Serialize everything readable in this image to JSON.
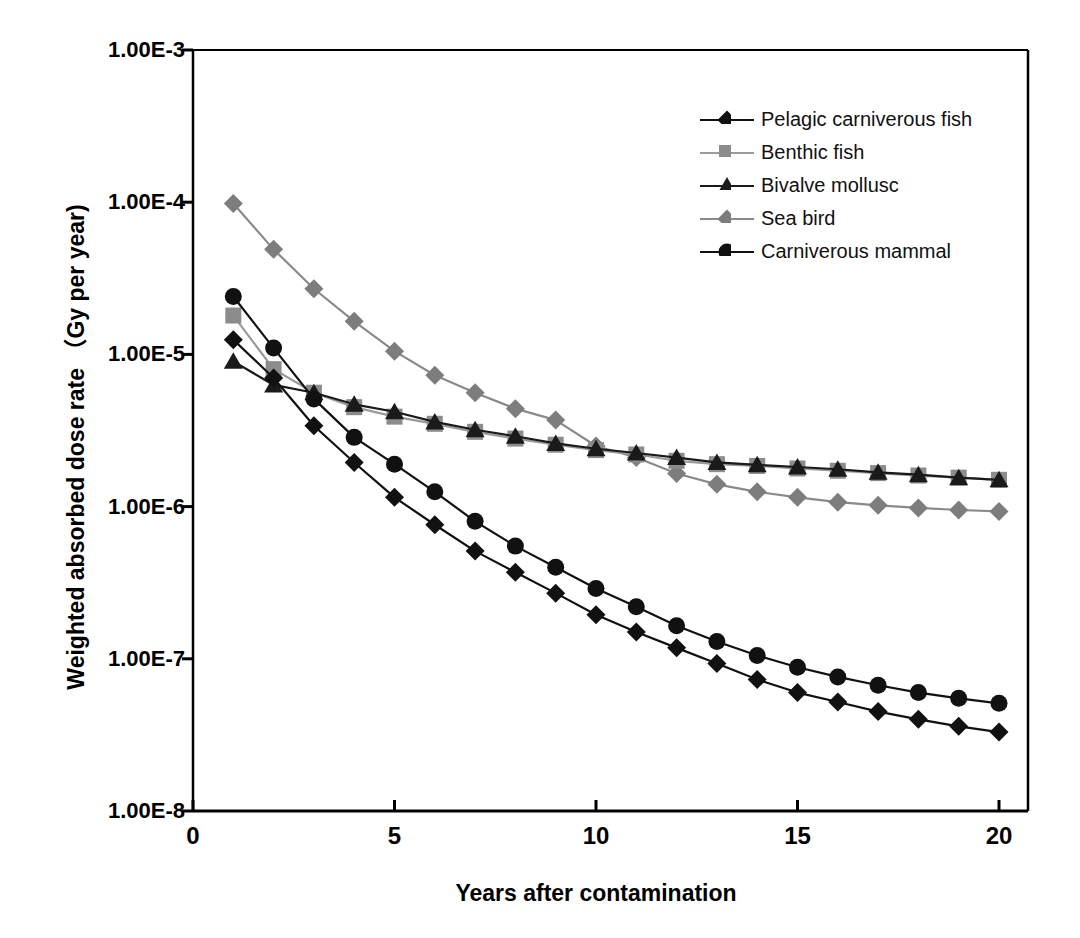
{
  "chart_data": {
    "type": "line",
    "title": "",
    "xlabel": "Years after contamination",
    "ylabel": "Weighted absorbed dose rate （Gy per year)",
    "xlim": [
      0,
      20
    ],
    "ylim": [
      1e-08,
      0.001
    ],
    "yscale": "log",
    "grid": false,
    "legend_position": "top-right",
    "x_ticks": [
      0,
      5,
      10,
      15,
      20
    ],
    "x_tick_labels": [
      "0",
      "5",
      "10",
      "15",
      "20"
    ],
    "y_ticks": [
      0.001,
      0.0001,
      1e-05,
      1e-06,
      1e-07,
      1e-08
    ],
    "y_tick_labels": [
      "1.00E-3",
      "1.00E-4",
      "1.00E-5",
      "1.00E-6",
      "1.00E-7",
      "1.00E-8"
    ],
    "x": [
      1,
      2,
      3,
      4,
      5,
      6,
      7,
      8,
      9,
      10,
      11,
      12,
      13,
      14,
      15,
      16,
      17,
      18,
      19,
      20
    ],
    "series": [
      {
        "name": "Pelagic carniverous fish",
        "marker": "diamond",
        "color": "#111111",
        "line_color": "#111111",
        "values": [
          1.25e-05,
          7e-06,
          3.4e-06,
          1.95e-06,
          1.15e-06,
          7.6e-07,
          5.1e-07,
          3.7e-07,
          2.7e-07,
          1.95e-07,
          1.5e-07,
          1.18e-07,
          9.3e-08,
          7.3e-08,
          6e-08,
          5.2e-08,
          4.5e-08,
          4e-08,
          3.6e-08,
          3.3e-08
        ]
      },
      {
        "name": "Benthic fish",
        "marker": "square",
        "color": "#8c8c8c",
        "line_color": "#9a9a9a",
        "values": [
          1.8e-05,
          8e-06,
          5.6e-06,
          4.5e-06,
          3.9e-06,
          3.5e-06,
          3.1e-06,
          2.8e-06,
          2.55e-06,
          2.35e-06,
          2.2e-06,
          2e-06,
          1.9e-06,
          1.85e-06,
          1.78e-06,
          1.72e-06,
          1.66e-06,
          1.6e-06,
          1.55e-06,
          1.5e-06
        ]
      },
      {
        "name": "Bivalve mollusc",
        "marker": "triangle",
        "color": "#1a1a1a",
        "line_color": "#1a1a1a",
        "values": [
          9e-06,
          6.3e-06,
          5.6e-06,
          4.7e-06,
          4.2e-06,
          3.6e-06,
          3.2e-06,
          2.9e-06,
          2.6e-06,
          2.4e-06,
          2.25e-06,
          2.1e-06,
          1.95e-06,
          1.88e-06,
          1.82e-06,
          1.76e-06,
          1.68e-06,
          1.62e-06,
          1.55e-06,
          1.5e-06
        ]
      },
      {
        "name": "Sea bird",
        "marker": "diamond",
        "color": "#7d7d7d",
        "line_color": "#8a8a8a",
        "values": [
          9.8e-05,
          4.9e-05,
          2.7e-05,
          1.65e-05,
          1.05e-05,
          7.3e-06,
          5.6e-06,
          4.4e-06,
          3.7e-06,
          2.5e-06,
          2.1e-06,
          1.65e-06,
          1.4e-06,
          1.25e-06,
          1.15e-06,
          1.07e-06,
          1.02e-06,
          9.8e-07,
          9.5e-07,
          9.3e-07
        ]
      },
      {
        "name": "Carniverous mammal",
        "marker": "circle",
        "color": "#111111",
        "line_color": "#111111",
        "values": [
          2.4e-05,
          1.1e-05,
          5.1e-06,
          2.85e-06,
          1.9e-06,
          1.25e-06,
          8e-07,
          5.5e-07,
          4e-07,
          2.9e-07,
          2.2e-07,
          1.65e-07,
          1.3e-07,
          1.05e-07,
          8.8e-08,
          7.6e-08,
          6.7e-08,
          6e-08,
          5.5e-08,
          5.1e-08
        ]
      }
    ]
  }
}
